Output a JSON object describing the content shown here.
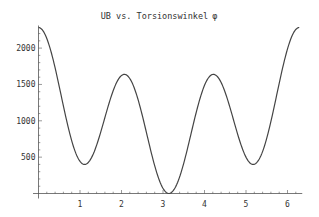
{
  "chart_data": {
    "type": "line",
    "title": "UB vs. Torsionswinkel",
    "title_symbol": "φ",
    "xlabel": "",
    "ylabel": "",
    "xlim": [
      0,
      6.2832
    ],
    "ylim": [
      0,
      2283
    ],
    "grid": false,
    "legend": null,
    "x_ticks": [
      1,
      2,
      3,
      4,
      5,
      6
    ],
    "y_ticks": [
      500,
      1000,
      1500,
      2000
    ],
    "model": {
      "formula": "A + B*cos(x) + C*cos(2x) + D*cos(3x)",
      "A": 1063.8,
      "B": 353.0,
      "C": 77.7,
      "D": 788.5
    },
    "series": [
      {
        "name": "UB",
        "x": [
          0,
          0.5,
          1.0,
          1.15,
          1.5,
          2.09,
          2.5,
          3.14,
          3.78,
          4.19,
          4.78,
          5.13,
          5.5,
          6.0,
          6.28
        ],
        "y": [
          2283,
          1500,
          430,
          413,
          900,
          1637,
          1050,
          0,
          1050,
          1637,
          900,
          413,
          750,
          1900,
          2283
        ]
      }
    ],
    "colors": {
      "line": "#444444",
      "axis": "#555555",
      "background": "#ffffff"
    }
  }
}
